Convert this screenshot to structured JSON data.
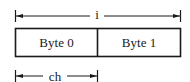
{
  "diagram": {
    "type": "memory-layout",
    "top_span": {
      "label": "i",
      "from": "Byte 0",
      "to": "Byte 1"
    },
    "cells": [
      {
        "label": "Byte 0"
      },
      {
        "label": "Byte 1"
      }
    ],
    "bottom_span": {
      "label": "ch",
      "from": "Byte 0",
      "to": "Byte 0"
    },
    "colors": {
      "stroke": "#1a1a1a",
      "background": "#ffffff"
    }
  }
}
